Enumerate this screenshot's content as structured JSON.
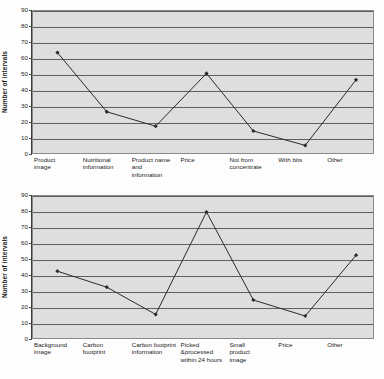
{
  "figure": {
    "background_color": "#fdfdfd",
    "plot_background_color": "#dedede",
    "gridline_color": "#606060",
    "series_color": "#2b2b2b"
  },
  "chart_data": [
    {
      "type": "line",
      "id": "orange-juice-packaging-features",
      "title": "",
      "xlabel": "",
      "ylabel": "Number of intervals",
      "ylim": [
        0,
        90
      ],
      "ytick_step": 10,
      "yticks": [
        "0",
        "10",
        "20",
        "30",
        "40",
        "50",
        "60",
        "70",
        "80",
        "90"
      ],
      "grid": true,
      "legend": "none",
      "marker": "filled-diamond",
      "categories": [
        "Product\nimage",
        "Nutritional\ninformation",
        "Product name\nand\ninformation",
        "Price",
        "Not from\nconcentrate",
        "With bits",
        "Other"
      ],
      "values": [
        64,
        27,
        18,
        51,
        15,
        6,
        47
      ]
    },
    {
      "type": "line",
      "id": "sustainability-packaging-features",
      "title": "",
      "xlabel": "",
      "ylabel": "Number of intervals",
      "ylim": [
        0,
        90
      ],
      "ytick_step": 10,
      "yticks": [
        "0",
        "10",
        "20",
        "30",
        "40",
        "50",
        "60",
        "70",
        "80",
        "90"
      ],
      "grid": true,
      "legend": "none",
      "marker": "filled-diamond",
      "categories": [
        "Background\nimage",
        "Carbon\nfootprint",
        "Carbon footprint\ninformation",
        "Picked\n&processed\nwithin 24 hours",
        "Small\nproduct\nimage",
        "Price",
        "Other"
      ],
      "values": [
        43,
        33,
        16,
        80,
        25,
        15,
        53
      ]
    }
  ]
}
